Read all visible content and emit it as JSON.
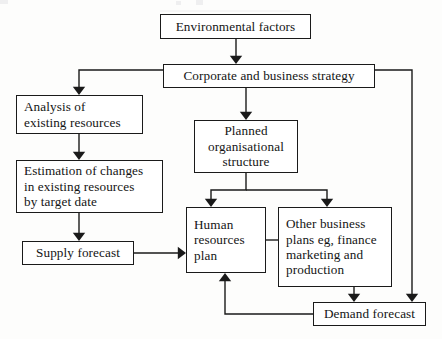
{
  "diagram": {
    "style": {
      "line_color": "#1a1a1a",
      "box_fill": "#ffffff",
      "text_color": "#141414",
      "page_background": "#fdfdfc"
    },
    "nodes": [
      {
        "id": "environmental-factors",
        "label": "Environmental factors",
        "x": 160,
        "y": 14,
        "w": 151,
        "h": 25,
        "align": "center"
      },
      {
        "id": "corporate-business-strategy",
        "label": "Corporate and business strategy",
        "x": 163,
        "y": 64,
        "w": 212,
        "h": 24,
        "align": "center"
      },
      {
        "id": "analysis-existing-resources",
        "label": "Analysis of\nexisting resources",
        "x": 16,
        "y": 95,
        "w": 127,
        "h": 39,
        "align": "left"
      },
      {
        "id": "estimation-of-changes",
        "label": "Estimation of changes\nin existing resources\nby target date",
        "x": 16,
        "y": 160,
        "w": 147,
        "h": 53,
        "align": "left"
      },
      {
        "id": "supply-forecast",
        "label": "Supply forecast",
        "x": 22,
        "y": 241,
        "w": 112,
        "h": 24,
        "align": "center"
      },
      {
        "id": "planned-organisational-structure",
        "label": "Planned\norganisational\nstructure",
        "x": 194,
        "y": 120,
        "w": 104,
        "h": 53,
        "align": "center"
      },
      {
        "id": "human-resources-plan",
        "label": "Human\nresources\nplan",
        "x": 186,
        "y": 207,
        "w": 80,
        "h": 66,
        "align": "left"
      },
      {
        "id": "other-business-plans",
        "label": "Other business\nplans eg, finance\nmarketing and\nproduction",
        "x": 278,
        "y": 207,
        "w": 114,
        "h": 80,
        "align": "left"
      },
      {
        "id": "demand-forecast",
        "label": "Demand forecast",
        "x": 313,
        "y": 302,
        "w": 113,
        "h": 24,
        "align": "center"
      }
    ],
    "connectors": [
      {
        "id": "environmental-to-corporate",
        "from": "environmental-factors",
        "to": "corporate-business-strategy",
        "path": "M 236 39 L 236 58",
        "arrow": {
          "x": 236,
          "y": 64,
          "dir": "down"
        }
      },
      {
        "id": "corporate-to-analysis",
        "from": "corporate-business-strategy",
        "to": "analysis-existing-resources",
        "path": "M 163 70 L 79 70 L 79 89",
        "arrow": {
          "x": 79,
          "y": 95,
          "dir": "down"
        }
      },
      {
        "id": "corporate-to-planned-structure",
        "from": "corporate-business-strategy",
        "to": "planned-organisational-structure",
        "path": "M 246 88 L 246 114",
        "arrow": {
          "x": 246,
          "y": 120,
          "dir": "down"
        }
      },
      {
        "id": "corporate-to-demand-forecast",
        "from": "corporate-business-strategy",
        "to": "demand-forecast",
        "path": "M 375 70 L 412 70 L 412 296",
        "arrow": {
          "x": 412,
          "y": 302,
          "dir": "down"
        }
      },
      {
        "id": "analysis-to-estimation",
        "from": "analysis-existing-resources",
        "to": "estimation-of-changes",
        "path": "M 79 134 L 79 154",
        "arrow": {
          "x": 79,
          "y": 160,
          "dir": "down"
        }
      },
      {
        "id": "estimation-to-supply-forecast",
        "from": "estimation-of-changes",
        "to": "supply-forecast",
        "path": "M 79 213 L 79 235",
        "arrow": {
          "x": 79,
          "y": 241,
          "dir": "down"
        }
      },
      {
        "id": "supply-forecast-to-hr-plan",
        "from": "supply-forecast",
        "to": "human-resources-plan",
        "path": "M 134 253 L 180 253",
        "arrow": {
          "x": 186,
          "y": 253,
          "dir": "right"
        }
      },
      {
        "id": "structure-to-hr-plan",
        "from": "planned-organisational-structure",
        "to": "human-resources-plan",
        "path": "M 246 173 L 246 190 L 211 190 L 211 201",
        "arrow": {
          "x": 211,
          "y": 207,
          "dir": "down"
        }
      },
      {
        "id": "structure-to-other-plans",
        "from": "planned-organisational-structure",
        "to": "other-business-plans",
        "path": "M 246 190 L 327 190 L 327 201",
        "arrow": {
          "x": 327,
          "y": 207,
          "dir": "down"
        }
      },
      {
        "id": "hr-plan-to-other-plans-link",
        "from": "human-resources-plan",
        "to": "other-business-plans",
        "path": "M 266 240 L 278 240",
        "arrow": null
      },
      {
        "id": "other-plans-to-demand-forecast",
        "from": "other-business-plans",
        "to": "demand-forecast",
        "path": "M 354 287 L 354 296",
        "arrow": {
          "x": 354,
          "y": 302,
          "dir": "down"
        }
      },
      {
        "id": "demand-forecast-to-hr-plan",
        "from": "demand-forecast",
        "to": "human-resources-plan",
        "path": "M 313 314 L 225 314 L 225 279",
        "arrow": {
          "x": 225,
          "y": 273,
          "dir": "up"
        }
      }
    ]
  }
}
